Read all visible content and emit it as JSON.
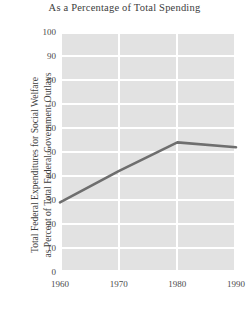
{
  "chart_data": {
    "type": "line",
    "title": "As a Percentage of  Total Spending",
    "xlabel": "",
    "ylabel_line1": "Total Federal Expenditures for Social Welfare",
    "ylabel_line2": "as Percent of Total Federal Government Outlays",
    "x": [
      1960,
      1970,
      1980,
      1990
    ],
    "values": [
      29,
      42,
      54,
      52
    ],
    "xticks": [
      "1960",
      "1970",
      "1980",
      "1990"
    ],
    "yticks": [
      "0",
      "10",
      "20",
      "30",
      "40",
      "50",
      "60",
      "70",
      "80",
      "90",
      "100"
    ],
    "xlim": [
      1960,
      1990
    ],
    "ylim": [
      0,
      100
    ],
    "grid": true,
    "legend": "none",
    "series_name": "Total Federal Expenditures for Social Welfare",
    "line_color": "#6e6e6e",
    "plot_background_color": "#e2e2e2",
    "gridline_color": "#ffffff",
    "text_color": "#3d3d3d"
  }
}
